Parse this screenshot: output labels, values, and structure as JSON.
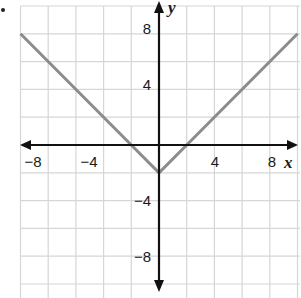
{
  "chart_data": {
    "type": "line",
    "title": "",
    "function": "y = |x| - 2",
    "xlabel": "x",
    "ylabel": "y",
    "xlim": [
      -10,
      10
    ],
    "ylim": [
      -10,
      10
    ],
    "grid": true,
    "grid_step": 2,
    "x_ticks": [
      -8,
      -4,
      4,
      8
    ],
    "y_ticks": [
      8,
      4,
      -4,
      -8
    ],
    "x_tick_labels": [
      "−8",
      "−4",
      "4",
      "8"
    ],
    "y_tick_labels": [
      "8",
      "4",
      "−4",
      "−8"
    ],
    "series": [
      {
        "name": "y = |x| - 2",
        "x": [
          -10,
          -2,
          0,
          2,
          10
        ],
        "y": [
          8,
          0,
          -2,
          0,
          8
        ],
        "color": "#8c8c8c"
      }
    ],
    "legend": null
  },
  "colors": {
    "grid": "#d6d6d6",
    "axis": "#111111",
    "curve": "#8c8c8c",
    "background": "#ffffff"
  },
  "labels": {
    "x_axis": "x",
    "y_axis": "y",
    "x_neg8": "−8",
    "x_neg4": "−4",
    "x_4": "4",
    "x_8": "8",
    "y_8": "8",
    "y_4": "4",
    "y_neg4": "−4",
    "y_neg8": "−8"
  }
}
